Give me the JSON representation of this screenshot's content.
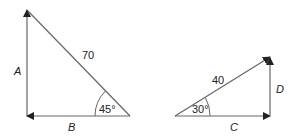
{
  "diagram": {
    "left_triangle": {
      "hypotenuse_label": "70",
      "vertical_label": "A",
      "horizontal_label": "B",
      "angle_label": "45°"
    },
    "right_triangle": {
      "hypotenuse_label": "40",
      "vertical_label": "D",
      "horizontal_label": "C",
      "angle_label": "30°"
    },
    "colors": {
      "line": "#555555",
      "text": "#222222"
    }
  }
}
